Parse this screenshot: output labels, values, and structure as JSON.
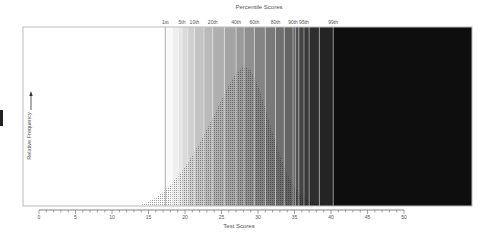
{
  "chart_data": {
    "type": "area",
    "title": "Percentile Scores",
    "xlabel": "Test Scores",
    "ylabel": "Relative Frequency",
    "xlim": [
      0,
      50
    ],
    "x_ticks": [
      0,
      5,
      10,
      15,
      20,
      25,
      30,
      35,
      40,
      45,
      50
    ],
    "x_tick_labels": [
      "0",
      "5",
      "10",
      "15",
      "20",
      "25",
      "30",
      "35",
      "40",
      "45",
      "50"
    ],
    "minor_tick_step": 1,
    "grid": false,
    "legend": "none",
    "percentile_markers": [
      {
        "label": "1st",
        "score": 17.3
      },
      {
        "label": "5th",
        "score": 19.6
      },
      {
        "label": "10th",
        "score": 21.3
      },
      {
        "label": "20th",
        "score": 23.8
      },
      {
        "label": "40th",
        "score": 27.0
      },
      {
        "label": "60th",
        "score": 29.5
      },
      {
        "label": "80th",
        "score": 32.4
      },
      {
        "label": "90th",
        "score": 34.8
      },
      {
        "label": "95th",
        "score": 36.3
      },
      {
        "label": "99th",
        "score": 40.3
      }
    ],
    "band_boundaries": [
      17.3,
      18.3,
      19.1,
      19.6,
      20.4,
      21.3,
      22.6,
      23.8,
      25.4,
      27.0,
      28.1,
      29.5,
      31.0,
      32.4,
      33.6,
      34.8,
      35.1,
      35.6,
      36.3,
      37.0,
      38.4,
      40.3
    ],
    "distribution": {
      "shape": "left-skewed",
      "x": [
        14,
        15,
        16,
        17,
        18,
        19,
        20,
        21,
        22,
        23,
        24,
        25,
        26,
        27,
        28,
        29,
        30,
        31,
        32,
        33,
        34,
        35,
        36,
        37,
        38,
        39,
        40
      ],
      "relative_frequency": [
        0.01,
        0.03,
        0.06,
        0.1,
        0.15,
        0.21,
        0.28,
        0.36,
        0.45,
        0.55,
        0.65,
        0.76,
        0.86,
        0.95,
        1.0,
        0.97,
        0.86,
        0.7,
        0.52,
        0.36,
        0.23,
        0.13,
        0.07,
        0.04,
        0.02,
        0.01,
        0.0
      ]
    }
  },
  "labels": {
    "title": "Percentile Scores",
    "xlabel": "Test Scores",
    "ylabel": "Relative Frequency"
  }
}
